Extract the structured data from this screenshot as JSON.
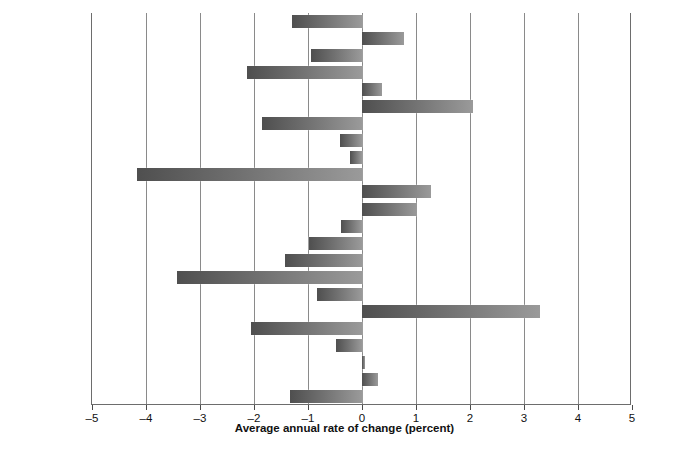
{
  "chart_data": {
    "type": "bar",
    "orientation": "horizontal",
    "title": "",
    "xlabel": "Average annual rate of change (percent)",
    "ylabel": "",
    "xlim": [
      -5,
      5
    ],
    "xticks": [
      "–5",
      "–4",
      "–3",
      "–2",
      "–1",
      "0",
      "1",
      "2",
      "3",
      "4",
      "5"
    ],
    "xtick_values": [
      -5,
      -4,
      -3,
      -2,
      -1,
      0,
      1,
      2,
      3,
      4,
      5
    ],
    "grid": "vertical",
    "legend": "none",
    "categories": [
      "Australia",
      "Austria",
      "Belgium",
      "Canada",
      "Denmark",
      "Finland",
      "France",
      "Hungary",
      "Ireland",
      "Italy",
      "Japan",
      "Luxembourg",
      "Netherlands",
      "New Zealand",
      "Norway",
      "Poland",
      "Portugal",
      "South Africa",
      "Spain",
      "Sweden",
      "Switzerland",
      "United Kingdom",
      "United States"
    ],
    "values": [
      -1.3,
      0.78,
      -0.94,
      -2.13,
      0.37,
      2.05,
      -1.85,
      -0.4,
      -0.22,
      -4.17,
      1.28,
      1.02,
      -0.38,
      -0.99,
      -1.42,
      -3.42,
      -0.83,
      3.3,
      -2.05,
      -0.49,
      0.05,
      0.3,
      -1.34
    ],
    "bar_gradient": [
      "#4f4f4f",
      "#9a9a9a"
    ],
    "axis_color": "#6d6d6d",
    "grid_color": "#8a8a8a",
    "background": "#ffffff"
  }
}
